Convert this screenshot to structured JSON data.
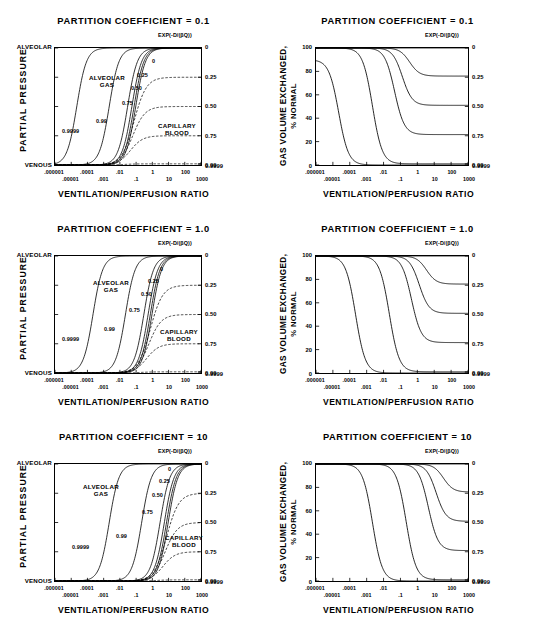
{
  "figure": {
    "panel_title_prefix": "PARTITION COEFFICIENT = ",
    "xlabel": "VENTILATION/PERFUSION RATIO",
    "exp_header": "EXP(-D/(βQ))",
    "left_ylabel": "PARTIAL PRESSURE",
    "right_ylabel_line1": "GAS VOLUME EXCHANGED,",
    "right_ylabel_line2": "% NORMAL",
    "alveolar_tag": "ALVEOLAR",
    "venous_tag": "VENOUS",
    "alveolar_gas_label_l1": "ALVEOLAR",
    "alveolar_gas_label_l2": "GAS",
    "capillary_label_l1": "CAPILLARY",
    "capillary_label_l2": "BLOOD",
    "x_ticks_row1": [
      ".000001",
      ".0001",
      ".01",
      "1",
      "100"
    ],
    "x_ticks_row2": [
      ".00001",
      ".001",
      ".1",
      "10",
      "1000"
    ],
    "right_axis_labels": [
      "0",
      "0.25",
      "0.50",
      "0.75",
      "0.99",
      "0.9999"
    ],
    "right_axis_values": [
      0,
      0.25,
      0.5,
      0.75,
      0.99,
      0.9999
    ],
    "y_ticks_right_panel": [
      "0",
      "20",
      "40",
      "60",
      "80",
      "100"
    ],
    "curve_annotations": [
      "0.9999",
      "0.99",
      "0.75",
      "0.50",
      "0.25",
      "0"
    ],
    "panels": [
      {
        "coefficient": "0.1"
      },
      {
        "coefficient": "1.0"
      },
      {
        "coefficient": "10"
      }
    ]
  },
  "chart_data": [
    {
      "type": "line",
      "title": "PARTITION COEFFICIENT = 0.1",
      "subplot": "left",
      "row": 0,
      "xlabel": "VENTILATION/PERFUSION RATIO",
      "ylabel": "PARTIAL PRESSURE",
      "xscale": "log",
      "xlim": [
        1e-06,
        1000
      ],
      "xticks": [
        1e-06,
        1e-05,
        0.0001,
        0.001,
        0.01,
        0.1,
        1,
        10,
        100,
        1000
      ],
      "xticklabels": [
        ".000001",
        ".00001",
        ".0001",
        ".001",
        ".01",
        ".1",
        "1",
        "10",
        "100",
        "1000"
      ],
      "ylim": [
        0,
        1
      ],
      "yticklabels": [
        "VENOUS",
        "ALVEOLAR"
      ],
      "right_axis_label": "EXP(-D/(βQ))",
      "right_axis_ticks": [
        0,
        0.25,
        0.5,
        0.75,
        0.99,
        0.9999
      ],
      "right_axis_ticklabels": [
        "0",
        "0.25",
        "0.50",
        "0.75",
        "0.99",
        "0.9999"
      ],
      "grid": false,
      "legend": "inline-annotations",
      "series": [
        {
          "name": "ALVEOLAR GAS, exp=0.9999",
          "style": "solid",
          "x50": 2.2e-05,
          "plateau": 1.0,
          "annotation": "0.9999"
        },
        {
          "name": "ALVEOLAR GAS, exp=0.99",
          "style": "solid",
          "x50": 0.0022,
          "plateau": 1.0,
          "annotation": "0.99"
        },
        {
          "name": "ALVEOLAR GAS, exp=0.75",
          "style": "solid",
          "x50": 0.03,
          "plateau": 1.0,
          "annotation": "0.75"
        },
        {
          "name": "ALVEOLAR GAS, exp=0.50",
          "style": "solid",
          "x50": 0.055,
          "plateau": 1.0,
          "annotation": "0.50"
        },
        {
          "name": "ALVEOLAR GAS, exp=0.25",
          "style": "solid",
          "x50": 0.075,
          "plateau": 1.0,
          "annotation": "0.25"
        },
        {
          "name": "ALVEOLAR GAS, exp=0",
          "style": "solid",
          "x50": 0.095,
          "plateau": 1.0,
          "annotation": "0"
        },
        {
          "name": "CAPILLARY BLOOD, exp=0.25",
          "style": "dashed",
          "x50": 0.075,
          "plateau": 0.75
        },
        {
          "name": "CAPILLARY BLOOD, exp=0.50",
          "style": "dashed",
          "x50": 0.062,
          "plateau": 0.5
        },
        {
          "name": "CAPILLARY BLOOD, exp=0.75",
          "style": "dashed",
          "x50": 0.045,
          "plateau": 0.25
        },
        {
          "name": "CAPILLARY BLOOD, exp=0.99",
          "style": "dashed",
          "x50": 0.02,
          "plateau": 0.01
        }
      ]
    },
    {
      "type": "line",
      "title": "PARTITION COEFFICIENT = 0.1",
      "subplot": "right",
      "row": 0,
      "xlabel": "VENTILATION/PERFUSION RATIO",
      "ylabel": "GAS VOLUME EXCHANGED, % NORMAL",
      "xscale": "log",
      "xlim": [
        1e-06,
        1000
      ],
      "ylim": [
        0,
        100
      ],
      "yticks": [
        0,
        20,
        40,
        60,
        80,
        100
      ],
      "right_axis_label": "EXP(-D/(βQ))",
      "right_axis_ticks": [
        0,
        0.25,
        0.5,
        0.75,
        0.99,
        0.9999
      ],
      "right_axis_ticklabels": [
        "0",
        "0.25",
        "0.50",
        "0.75",
        "0.99",
        "0.9999"
      ],
      "grid": false,
      "series": [
        {
          "name": "exp=0",
          "plateau": 100,
          "x50": 3000,
          "start": 100
        },
        {
          "name": "exp=0.25",
          "plateau": 76,
          "x50": 0.35,
          "start": 100
        },
        {
          "name": "exp=0.50",
          "plateau": 51,
          "x50": 0.13,
          "start": 100
        },
        {
          "name": "exp=0.75",
          "plateau": 26,
          "x50": 0.045,
          "start": 100
        },
        {
          "name": "exp=0.99",
          "plateau": 1,
          "x50": 0.0022,
          "start": 100
        },
        {
          "name": "exp=0.9999",
          "plateau": 0,
          "x50": 2.2e-05,
          "start": 90
        }
      ]
    },
    {
      "type": "line",
      "title": "PARTITION COEFFICIENT = 1.0",
      "subplot": "left",
      "row": 1,
      "xlabel": "VENTILATION/PERFUSION RATIO",
      "ylabel": "PARTIAL PRESSURE",
      "xscale": "log",
      "xlim": [
        1e-06,
        1000
      ],
      "ylim": [
        0,
        1
      ],
      "right_axis_ticks": [
        0,
        0.25,
        0.5,
        0.75,
        0.99,
        0.9999
      ],
      "grid": false,
      "series": [
        {
          "name": "ALVEOLAR GAS, exp=0.9999",
          "style": "solid",
          "x50": 0.00022,
          "plateau": 1.0,
          "annotation": "0.9999"
        },
        {
          "name": "ALVEOLAR GAS, exp=0.99",
          "style": "solid",
          "x50": 0.022,
          "plateau": 1.0,
          "annotation": "0.99"
        },
        {
          "name": "ALVEOLAR GAS, exp=0.75",
          "style": "solid",
          "x50": 0.3,
          "plateau": 1.0,
          "annotation": "0.75"
        },
        {
          "name": "ALVEOLAR GAS, exp=0.50",
          "style": "solid",
          "x50": 0.55,
          "plateau": 1.0,
          "annotation": "0.50"
        },
        {
          "name": "ALVEOLAR GAS, exp=0.25",
          "style": "solid",
          "x50": 0.75,
          "plateau": 1.0,
          "annotation": "0.25"
        },
        {
          "name": "ALVEOLAR GAS, exp=0",
          "style": "solid",
          "x50": 0.95,
          "plateau": 1.0,
          "annotation": "0"
        },
        {
          "name": "CAPILLARY BLOOD, exp=0.25",
          "style": "dashed",
          "x50": 0.75,
          "plateau": 0.75
        },
        {
          "name": "CAPILLARY BLOOD, exp=0.50",
          "style": "dashed",
          "x50": 0.62,
          "plateau": 0.5
        },
        {
          "name": "CAPILLARY BLOOD, exp=0.75",
          "style": "dashed",
          "x50": 0.45,
          "plateau": 0.25
        },
        {
          "name": "CAPILLARY BLOOD, exp=0.99",
          "style": "dashed",
          "x50": 0.2,
          "plateau": 0.01
        }
      ]
    },
    {
      "type": "line",
      "title": "PARTITION COEFFICIENT = 1.0",
      "subplot": "right",
      "row": 1,
      "xlabel": "VENTILATION/PERFUSION RATIO",
      "ylabel": "GAS VOLUME EXCHANGED, % NORMAL",
      "xscale": "log",
      "xlim": [
        1e-06,
        1000
      ],
      "ylim": [
        0,
        100
      ],
      "yticks": [
        0,
        20,
        40,
        60,
        80,
        100
      ],
      "grid": false,
      "series": [
        {
          "name": "exp=0",
          "plateau": 100,
          "x50": 30000,
          "start": 100
        },
        {
          "name": "exp=0.25",
          "plateau": 76,
          "x50": 3.5,
          "start": 100
        },
        {
          "name": "exp=0.50",
          "plateau": 51,
          "x50": 1.3,
          "start": 100
        },
        {
          "name": "exp=0.75",
          "plateau": 26,
          "x50": 0.45,
          "start": 100
        },
        {
          "name": "exp=0.99",
          "plateau": 1,
          "x50": 0.022,
          "start": 100
        },
        {
          "name": "exp=0.9999",
          "plateau": 0,
          "x50": 0.00022,
          "start": 100
        }
      ]
    },
    {
      "type": "line",
      "title": "PARTITION COEFFICIENT = 10",
      "subplot": "left",
      "row": 2,
      "xlabel": "VENTILATION/PERFUSION RATIO",
      "ylabel": "PARTIAL PRESSURE",
      "xscale": "log",
      "xlim": [
        1e-06,
        1000
      ],
      "ylim": [
        0,
        1
      ],
      "right_axis_ticks": [
        0,
        0.25,
        0.5,
        0.75,
        0.99,
        0.9999
      ],
      "grid": false,
      "series": [
        {
          "name": "ALVEOLAR GAS, exp=0.9999",
          "style": "solid",
          "x50": 0.0022,
          "plateau": 1.0,
          "annotation": "0.9999"
        },
        {
          "name": "ALVEOLAR GAS, exp=0.99",
          "style": "solid",
          "x50": 0.22,
          "plateau": 1.0,
          "annotation": "0.99"
        },
        {
          "name": "ALVEOLAR GAS, exp=0.75",
          "style": "solid",
          "x50": 3.0,
          "plateau": 1.0,
          "annotation": "0.75"
        },
        {
          "name": "ALVEOLAR GAS, exp=0.50",
          "style": "solid",
          "x50": 5.5,
          "plateau": 1.0,
          "annotation": "0.50"
        },
        {
          "name": "ALVEOLAR GAS, exp=0.25",
          "style": "solid",
          "x50": 7.5,
          "plateau": 1.0,
          "annotation": "0.25"
        },
        {
          "name": "ALVEOLAR GAS, exp=0",
          "style": "solid",
          "x50": 9.5,
          "plateau": 1.0,
          "annotation": "0"
        },
        {
          "name": "CAPILLARY BLOOD, exp=0.25",
          "style": "dashed",
          "x50": 7.5,
          "plateau": 0.75
        },
        {
          "name": "CAPILLARY BLOOD, exp=0.50",
          "style": "dashed",
          "x50": 6.2,
          "plateau": 0.5
        },
        {
          "name": "CAPILLARY BLOOD, exp=0.75",
          "style": "dashed",
          "x50": 4.5,
          "plateau": 0.25
        },
        {
          "name": "CAPILLARY BLOOD, exp=0.99",
          "style": "dashed",
          "x50": 2.0,
          "plateau": 0.01
        }
      ]
    },
    {
      "type": "line",
      "title": "PARTITION COEFFICIENT = 10",
      "subplot": "right",
      "row": 2,
      "xlabel": "VENTILATION/PERFUSION RATIO",
      "ylabel": "GAS VOLUME EXCHANGED, % NORMAL",
      "xscale": "log",
      "xlim": [
        1e-06,
        1000
      ],
      "ylim": [
        0,
        100
      ],
      "yticks": [
        0,
        20,
        40,
        60,
        80,
        100
      ],
      "grid": false,
      "series": [
        {
          "name": "exp=0",
          "plateau": 100,
          "x50": 300000,
          "start": 100
        },
        {
          "name": "exp=0.25",
          "plateau": 76,
          "x50": 35,
          "start": 100
        },
        {
          "name": "exp=0.50",
          "plateau": 51,
          "x50": 13,
          "start": 100
        },
        {
          "name": "exp=0.75",
          "plateau": 26,
          "x50": 4.5,
          "start": 100
        },
        {
          "name": "exp=0.99",
          "plateau": 1,
          "x50": 0.22,
          "start": 100
        },
        {
          "name": "exp=0.9999",
          "plateau": 0,
          "x50": 0.0022,
          "start": 100
        }
      ]
    }
  ]
}
